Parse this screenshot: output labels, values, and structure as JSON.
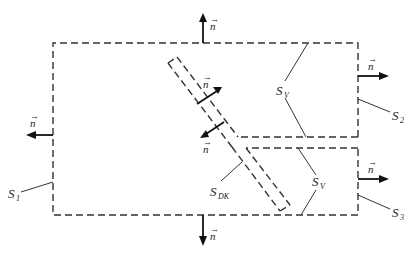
{
  "diagram": {
    "type": "control-volume-boundary-schematic",
    "normal_symbol": "n",
    "labels": {
      "s1": {
        "base": "S",
        "sub": "1"
      },
      "s2": {
        "base": "S",
        "sub": "2"
      },
      "s3": {
        "base": "S",
        "sub": "3"
      },
      "sv_upper": {
        "base": "S",
        "sub": "V"
      },
      "sv_lower": {
        "base": "S",
        "sub": "V"
      },
      "sdk": {
        "base": "S",
        "sub": "DK"
      }
    },
    "normals": [
      {
        "id": "top",
        "label": "n",
        "direction": "up"
      },
      {
        "id": "bottom",
        "label": "n",
        "direction": "down"
      },
      {
        "id": "left",
        "label": "n",
        "direction": "left"
      },
      {
        "id": "right-upper",
        "label": "n",
        "direction": "right"
      },
      {
        "id": "right-lower",
        "label": "n",
        "direction": "right"
      },
      {
        "id": "channel-upper",
        "label": "n",
        "direction": "up-right"
      },
      {
        "id": "channel-lower",
        "label": "n",
        "direction": "down-left"
      }
    ],
    "colors": {
      "line": "#333333",
      "arrow": "#111111",
      "background": "#ffffff"
    }
  }
}
